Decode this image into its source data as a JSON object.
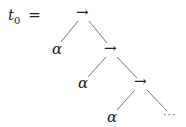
{
  "equation": {
    "lhs": "t",
    "lhs_subscript": "0",
    "equals": "="
  },
  "tree": {
    "nodes": [
      {
        "id": "arrow1",
        "label": "→"
      },
      {
        "id": "alpha1",
        "label": "α"
      },
      {
        "id": "arrow2",
        "label": "→"
      },
      {
        "id": "alpha2",
        "label": "α"
      },
      {
        "id": "arrow3",
        "label": "→"
      },
      {
        "id": "alpha3",
        "label": "α"
      },
      {
        "id": "ellipsis",
        "label": "···"
      }
    ],
    "edges": [
      [
        "arrow1",
        "alpha1"
      ],
      [
        "arrow1",
        "arrow2"
      ],
      [
        "arrow2",
        "alpha2"
      ],
      [
        "arrow2",
        "arrow3"
      ],
      [
        "arrow3",
        "alpha3"
      ],
      [
        "arrow3",
        "ellipsis"
      ]
    ]
  }
}
